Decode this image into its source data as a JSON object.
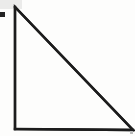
{
  "figure": {
    "title": "right-triangle-line-drawing",
    "canvas": {
      "width": 135,
      "height": 136,
      "background_color": "#fdfdfc"
    },
    "shape": {
      "name": "right-triangle",
      "type": "polygon",
      "stroke_color": "#1c1c1c",
      "stroke_width": 2.4,
      "fill": "none",
      "right_angle_corner": "bottom-left",
      "vertices": [
        {
          "label": "apex",
          "x": 15,
          "y": 7
        },
        {
          "label": "bottom-left",
          "x": 15,
          "y": 129
        },
        {
          "label": "bottom-right",
          "x": 133,
          "y": 130
        }
      ],
      "edges": [
        {
          "name": "vertical-leg",
          "from": "apex",
          "to": "bottom-left",
          "length_px": 122
        },
        {
          "name": "horizontal-leg",
          "from": "bottom-left",
          "to": "bottom-right",
          "length_px": 118
        },
        {
          "name": "hypotenuse",
          "from": "apex",
          "to": "bottom-right",
          "length_px": 170
        }
      ]
    },
    "marks": [
      {
        "name": "left-edge-dot",
        "type": "square",
        "color": "#232323",
        "x": 0,
        "y": 12,
        "width": 5,
        "height": 5
      },
      {
        "name": "top-left-smudge",
        "type": "smudge",
        "color": "#e8e8e6",
        "x": 0,
        "y": 0,
        "width": 22,
        "height": 9
      },
      {
        "name": "bottom-right-speck",
        "type": "speck",
        "color": "#bdbdbd",
        "x": 130,
        "y": 131,
        "width": 3,
        "height": 3
      }
    ]
  }
}
